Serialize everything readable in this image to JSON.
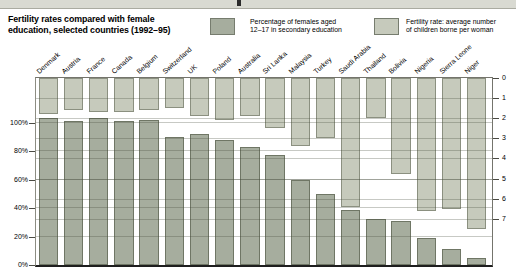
{
  "header": {
    "title_line1": "Fertility rates compared with female",
    "title_line2": "education, selected countries (1992–95)"
  },
  "legend": {
    "items": [
      {
        "line1": "Percentage of females aged",
        "line2": "12–17 in secondary education",
        "color": "#a6ad9e"
      },
      {
        "line1": "Fertility rate: average number",
        "line2": "of children borne per woman",
        "color": "#c6cabc"
      }
    ]
  },
  "chart_data": {
    "type": "bar",
    "layout": "dual-baseline-columns",
    "categories": [
      "Denmark",
      "Austria",
      "France",
      "Canada",
      "Belgium",
      "Switzerland",
      "UK",
      "Poland",
      "Australia",
      "Sri Lanka",
      "Malaysia",
      "Turkey",
      "Saudi Arabia",
      "Thailand",
      "Bolivia",
      "Nigeria",
      "Sierra Leone",
      "Niger"
    ],
    "series": [
      {
        "name": "Percentage of females aged 12–17 in secondary education",
        "axis": "left",
        "baseline": "bottom",
        "unit": "%",
        "color": "#a6ad9e",
        "values": [
          103,
          101,
          103,
          101,
          102,
          90,
          92,
          88,
          83,
          77,
          60,
          50,
          39,
          32,
          31,
          19,
          11,
          5
        ]
      },
      {
        "name": "Fertility rate: average number of children borne per woman",
        "axis": "right",
        "baseline": "top",
        "unit": "children per woman",
        "color": "#c6cabc",
        "values": [
          1.8,
          1.6,
          1.7,
          1.7,
          1.6,
          1.5,
          1.9,
          2.1,
          1.9,
          2.5,
          3.4,
          3.0,
          6.4,
          2.0,
          4.8,
          6.6,
          6.5,
          7.5
        ]
      }
    ],
    "left_axis": {
      "tick_labels": [
        "0%",
        "20%",
        "40%",
        "60%",
        "80%",
        "100%"
      ],
      "tick_values": [
        0,
        20,
        40,
        60,
        80,
        100
      ],
      "top_of_plot_value": 131
    },
    "right_axis": {
      "tick_labels": [
        "0",
        "1",
        "2",
        "3",
        "4",
        "5",
        "6",
        "7"
      ],
      "tick_values": [
        0,
        1,
        2,
        3,
        4,
        5,
        6,
        7
      ],
      "direction": "downward",
      "bottom_of_plot_value": 9.3
    },
    "grid": {
      "left_lines": [
        20,
        40,
        60,
        80,
        100
      ],
      "right_lines": [
        1,
        2,
        3,
        4,
        5,
        6,
        7
      ]
    }
  }
}
